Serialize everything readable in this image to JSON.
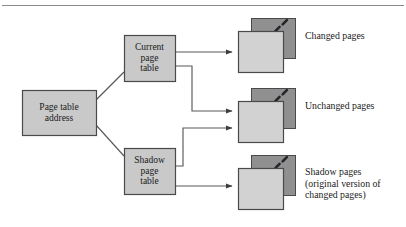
{
  "figure": {
    "type": "block-diagram",
    "top_rule": true,
    "colors": {
      "box_fill": "#c9c9c9",
      "box_border": "#4a4a4a",
      "page_back_fill": "#909090",
      "page_front_fill": "#d2d2d2",
      "page_border": "#4a4a4a",
      "line": "#595959",
      "text": "#1a1a1a",
      "rule": "#8a8a8a",
      "background": "#ffffff"
    }
  },
  "boxes": [
    {
      "id": "page-table-address",
      "name": "page-table-address-box",
      "label": "Page table\naddress",
      "x": 22,
      "y": 90,
      "w": 74,
      "h": 45
    },
    {
      "id": "current-page-table",
      "name": "current-page-table-box",
      "label": "Current\npage\ntable",
      "x": 124,
      "y": 35,
      "w": 51,
      "h": 46
    },
    {
      "id": "shadow-page-table",
      "name": "shadow-page-table-box",
      "label": "Shadow\npage\ntable",
      "x": 124,
      "y": 148,
      "w": 51,
      "h": 46
    }
  ],
  "page_groups": [
    {
      "id": "changed-pages",
      "name": "changed-pages-icon",
      "caption": "Changed pages",
      "back": {
        "x": 251,
        "y": 18,
        "w": 44,
        "h": 40
      },
      "front": {
        "x": 238,
        "y": 31,
        "w": 45,
        "h": 41
      },
      "caption_x": 305,
      "caption_y": 30,
      "dashes": 4
    },
    {
      "id": "unchanged-pages",
      "name": "unchanged-pages-icon",
      "caption": "Unchanged pages",
      "back": {
        "x": 251,
        "y": 88,
        "w": 44,
        "h": 40
      },
      "front": {
        "x": 238,
        "y": 101,
        "w": 45,
        "h": 41
      },
      "caption_x": 305,
      "caption_y": 100,
      "dashes": 4
    },
    {
      "id": "shadow-pages",
      "name": "shadow-pages-icon",
      "caption": "Shadow pages\n(original version of\nchanged pages)",
      "back": {
        "x": 251,
        "y": 155,
        "w": 44,
        "h": 40
      },
      "front": {
        "x": 238,
        "y": 168,
        "w": 45,
        "h": 41
      },
      "caption_x": 305,
      "caption_y": 166,
      "dashes": 4
    }
  ],
  "connectors": [
    {
      "name": "connector-address-to-current",
      "from": "page-table-address",
      "to": "current-page-table",
      "arrow": false,
      "points": "96,100 124,72"
    },
    {
      "name": "connector-address-to-shadow",
      "from": "page-table-address",
      "to": "shadow-page-table",
      "arrow": false,
      "points": "96,125 124,156"
    },
    {
      "name": "arrow-current-to-changed",
      "from": "current-page-table",
      "to": "changed-pages",
      "arrow": true,
      "points": "175,52 232,52"
    },
    {
      "name": "arrow-current-to-unchanged",
      "from": "current-page-table",
      "to": "unchanged-pages",
      "arrow": true,
      "points": "175,66 192,66 192,111 232,111"
    },
    {
      "name": "arrow-shadow-to-unchanged",
      "from": "shadow-page-table",
      "to": "unchanged-pages",
      "arrow": true,
      "points": "175,166 183,166 183,128 232,128"
    },
    {
      "name": "arrow-shadow-to-shadowpages",
      "from": "shadow-page-table",
      "to": "shadow-pages",
      "arrow": true,
      "points": "175,186 232,186"
    }
  ],
  "fonts": {
    "box_size": "9.5px",
    "caption_size": "9.8px"
  }
}
